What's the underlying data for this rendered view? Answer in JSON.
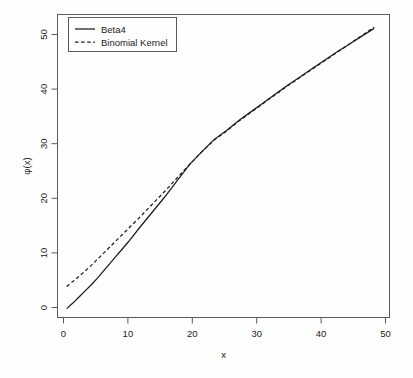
{
  "chart_data": {
    "type": "line",
    "title": "",
    "xlabel": "x",
    "ylabel": "φ(x)",
    "xlim": [
      -1.5,
      52.5
    ],
    "ylim": [
      -1.6,
      53.0
    ],
    "xticks": [
      0,
      10,
      20,
      30,
      40,
      50
    ],
    "yticks": [
      0,
      10,
      20,
      30,
      40,
      50
    ],
    "xticklabels": [
      "0",
      "10",
      "20",
      "30",
      "40",
      "50"
    ],
    "yticklabels": [
      "0",
      "10",
      "20",
      "30",
      "40",
      "50"
    ],
    "grid": false,
    "legend_position": "top-left",
    "legend_entries": [
      {
        "label": "Beta4",
        "style": "solid",
        "color": "#1c1c1c"
      },
      {
        "label": "Binomial Kernel",
        "style": "dashed",
        "color": "#1c1c1c"
      }
    ],
    "x": [
      0,
      1,
      2,
      3,
      4,
      5,
      6,
      7,
      8,
      9,
      10,
      12,
      14,
      16,
      18,
      20,
      22,
      24,
      26,
      28,
      30,
      32,
      34,
      36,
      38,
      40,
      42,
      44,
      46,
      48,
      50
    ],
    "series": [
      {
        "name": "Beta4",
        "style": "solid",
        "color": "#1c1c1c",
        "values": [
          0.0,
          1.0,
          2.1,
          3.2,
          4.3,
          5.5,
          6.8,
          8.1,
          9.4,
          10.7,
          12.0,
          14.8,
          17.5,
          20.2,
          23.1,
          26.0,
          28.3,
          30.5,
          32.1,
          33.9,
          35.5,
          37.1,
          38.7,
          40.3,
          41.8,
          43.3,
          44.8,
          46.3,
          47.7,
          49.1,
          50.5
        ]
      },
      {
        "name": "Binomial Kernel",
        "style": "dashed",
        "color": "#1c1c1c",
        "values": [
          4.0,
          4.9,
          5.8,
          6.8,
          7.8,
          8.9,
          10.0,
          11.1,
          12.2,
          13.3,
          14.4,
          16.6,
          18.9,
          21.2,
          23.6,
          26.0,
          28.3,
          30.4,
          32.0,
          33.8,
          35.4,
          37.0,
          38.6,
          40.2,
          41.7,
          43.2,
          44.7,
          46.2,
          47.7,
          49.2,
          50.7
        ]
      }
    ]
  },
  "axes": {
    "x_title": "x",
    "y_title": "φ(x)"
  },
  "legend": {
    "item_0_label": "Beta4",
    "item_1_label": "Binomial Kernel"
  },
  "ticks": {
    "x": [
      "0",
      "10",
      "20",
      "30",
      "40",
      "50"
    ],
    "y": [
      "0",
      "10",
      "20",
      "30",
      "40",
      "50"
    ]
  },
  "colors": {
    "line": "#1c1c1c",
    "frame": "#5a5a5a",
    "text": "#222222",
    "background": "#fefefe"
  }
}
